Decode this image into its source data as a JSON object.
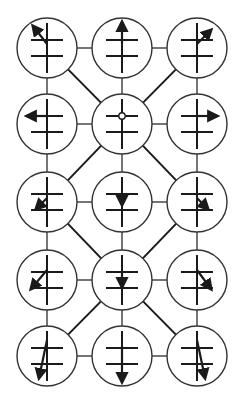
{
  "diagram": {
    "title": "",
    "colors": {
      "stroke": "#1a1a1a",
      "circle": "#333333",
      "background": "#ffffff"
    },
    "grid": {
      "columns_x": [
        47,
        122,
        197
      ],
      "rows_y": [
        48,
        124,
        202,
        280,
        356
      ],
      "radius": 30
    },
    "nodes": [
      {
        "id": "r1c1",
        "row": 0,
        "col": 0,
        "marker": "arrow",
        "vector": [
          [
            0,
            -4
          ],
          [
            -14,
            -22
          ]
        ],
        "direction": "up-left"
      },
      {
        "id": "r1c2",
        "row": 0,
        "col": 1,
        "marker": "arrow",
        "vector": [
          [
            0,
            -4
          ],
          [
            0,
            -26
          ]
        ],
        "direction": "up"
      },
      {
        "id": "r1c3",
        "row": 0,
        "col": 2,
        "marker": "arrow",
        "vector": [
          [
            0,
            -4
          ],
          [
            14,
            -18
          ]
        ],
        "direction": "up-right"
      },
      {
        "id": "r2c1",
        "row": 1,
        "col": 0,
        "marker": "arrow",
        "vector": [
          [
            0,
            -8
          ],
          [
            -20,
            -8
          ]
        ],
        "direction": "left"
      },
      {
        "id": "r2c2",
        "row": 1,
        "col": 1,
        "marker": "dot",
        "vector": [
          [
            0,
            -8
          ],
          [
            0,
            -8
          ]
        ],
        "direction": "none"
      },
      {
        "id": "r2c3",
        "row": 1,
        "col": 2,
        "marker": "arrow",
        "vector": [
          [
            0,
            -8
          ],
          [
            20,
            -8
          ]
        ],
        "direction": "right"
      },
      {
        "id": "r3c1",
        "row": 2,
        "col": 0,
        "marker": "arrow",
        "vector": [
          [
            0,
            -4
          ],
          [
            -11,
            7
          ]
        ],
        "direction": "down-left"
      },
      {
        "id": "r3c2",
        "row": 2,
        "col": 1,
        "marker": "arrow",
        "vector": [
          [
            0,
            -9
          ],
          [
            0,
            3
          ]
        ],
        "direction": "down"
      },
      {
        "id": "r3c3",
        "row": 2,
        "col": 2,
        "marker": "arrow",
        "vector": [
          [
            0,
            -4
          ],
          [
            11,
            7
          ]
        ],
        "direction": "down-right"
      },
      {
        "id": "r4c1",
        "row": 3,
        "col": 0,
        "marker": "arrow",
        "vector": [
          [
            0,
            -10
          ],
          [
            -16,
            9
          ]
        ],
        "direction": "down-left"
      },
      {
        "id": "r4c2",
        "row": 3,
        "col": 1,
        "marker": "arrow",
        "vector": [
          [
            0,
            -8
          ],
          [
            0,
            7
          ]
        ],
        "direction": "down"
      },
      {
        "id": "r4c3",
        "row": 3,
        "col": 2,
        "marker": "arrow",
        "vector": [
          [
            0,
            -10
          ],
          [
            14,
            9
          ]
        ],
        "direction": "down-right"
      },
      {
        "id": "r5c1",
        "row": 4,
        "col": 0,
        "marker": "arrow",
        "vector": [
          [
            0,
            -16
          ],
          [
            -8,
            22
          ]
        ],
        "direction": "down-slight-left"
      },
      {
        "id": "r5c2",
        "row": 4,
        "col": 1,
        "marker": "arrow",
        "vector": [
          [
            0,
            -10
          ],
          [
            0,
            26
          ]
        ],
        "direction": "down"
      },
      {
        "id": "r5c3",
        "row": 4,
        "col": 2,
        "marker": "arrow",
        "vector": [
          [
            0,
            -16
          ],
          [
            8,
            22
          ]
        ],
        "direction": "down-slight-right"
      }
    ],
    "edges": [
      [
        "r1c1",
        "r1c2"
      ],
      [
        "r1c2",
        "r1c3"
      ],
      [
        "r2c1",
        "r2c2"
      ],
      [
        "r2c2",
        "r2c3"
      ],
      [
        "r3c1",
        "r3c2"
      ],
      [
        "r3c2",
        "r3c3"
      ],
      [
        "r4c1",
        "r4c2"
      ],
      [
        "r4c2",
        "r4c3"
      ],
      [
        "r5c1",
        "r5c2"
      ],
      [
        "r5c2",
        "r5c3"
      ],
      [
        "r1c1",
        "r2c1"
      ],
      [
        "r2c1",
        "r3c1"
      ],
      [
        "r3c1",
        "r4c1"
      ],
      [
        "r4c1",
        "r5c1"
      ],
      [
        "r1c2",
        "r2c2"
      ],
      [
        "r2c2",
        "r3c2"
      ],
      [
        "r3c2",
        "r4c2"
      ],
      [
        "r4c2",
        "r5c2"
      ],
      [
        "r1c3",
        "r2c3"
      ],
      [
        "r2c3",
        "r3c3"
      ],
      [
        "r3c3",
        "r4c3"
      ],
      [
        "r4c3",
        "r5c3"
      ]
    ],
    "diagonals": [
      [
        "r1c1",
        "r2c2"
      ],
      [
        "r1c3",
        "r2c2"
      ],
      [
        "r2c2",
        "r3c1"
      ],
      [
        "r2c2",
        "r3c3"
      ],
      [
        "r3c1",
        "r4c2"
      ],
      [
        "r3c3",
        "r4c2"
      ],
      [
        "r4c2",
        "r5c1"
      ],
      [
        "r4c2",
        "r5c3"
      ]
    ],
    "symbol": {
      "vertical_half_length": 25,
      "bar_half_width": 16,
      "bar_offsets_y": [
        -8,
        8
      ]
    }
  }
}
